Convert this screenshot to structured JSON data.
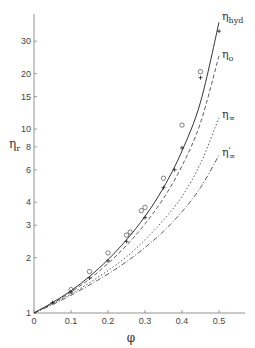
{
  "chart_data": {
    "type": "line",
    "title": "",
    "xlabel": "φ",
    "ylabel": "ηr",
    "xscale": "linear",
    "yscale": "log",
    "xlim": [
      0,
      0.57
    ],
    "ylim": [
      1,
      45
    ],
    "x_ticks": [
      0,
      0.1,
      0.2,
      0.3,
      0.4,
      0.5
    ],
    "x_tick_labels": [
      "0",
      "0.1",
      "0.2",
      "0.3",
      "0.4",
      "0.5"
    ],
    "y_ticks": [
      1,
      2,
      3,
      4,
      6,
      8,
      10,
      15,
      20,
      30
    ],
    "y_tick_labels": [
      "1",
      "2",
      "3",
      "4",
      "6",
      "8",
      "10",
      "15",
      "20",
      "30"
    ],
    "grid": false,
    "legend": "inline labels at curve ends",
    "series": [
      {
        "name": "η_hyd",
        "label_main": "η",
        "label_sub": "hyd",
        "label_sup": "",
        "style": "solid",
        "x": [
          0,
          0.05,
          0.1,
          0.15,
          0.2,
          0.25,
          0.3,
          0.35,
          0.4,
          0.45,
          0.5
        ],
        "values": [
          1.0,
          1.14,
          1.32,
          1.58,
          1.95,
          2.5,
          3.35,
          4.8,
          7.6,
          14.0,
          38.0
        ]
      },
      {
        "name": "η_o",
        "label_main": "η",
        "label_sub": "o",
        "label_sup": "",
        "style": "dashed",
        "x": [
          0,
          0.05,
          0.1,
          0.15,
          0.2,
          0.25,
          0.3,
          0.35,
          0.4,
          0.45,
          0.5
        ],
        "values": [
          1.0,
          1.13,
          1.3,
          1.53,
          1.86,
          2.33,
          3.05,
          4.2,
          6.3,
          10.8,
          25.0
        ]
      },
      {
        "name": "η_∞",
        "label_main": "η",
        "label_sub": "∞",
        "label_sup": "",
        "style": "dotted",
        "x": [
          0,
          0.05,
          0.1,
          0.15,
          0.2,
          0.25,
          0.3,
          0.35,
          0.4,
          0.45,
          0.5
        ],
        "values": [
          1.0,
          1.12,
          1.27,
          1.46,
          1.7,
          2.02,
          2.5,
          3.2,
          4.3,
          6.5,
          11.5
        ]
      },
      {
        "name": "η'_∞",
        "label_main": "η",
        "label_sub": "∞",
        "label_sup": "'",
        "style": "dashdot",
        "x": [
          0,
          0.05,
          0.1,
          0.15,
          0.2,
          0.25,
          0.3,
          0.35,
          0.4,
          0.45,
          0.5
        ],
        "values": [
          1.0,
          1.11,
          1.25,
          1.42,
          1.63,
          1.9,
          2.27,
          2.78,
          3.55,
          4.8,
          7.2
        ]
      }
    ],
    "markers": [
      {
        "name": "circles",
        "symbol": "o",
        "x": [
          0.1,
          0.15,
          0.2,
          0.25,
          0.26,
          0.29,
          0.3,
          0.35,
          0.4,
          0.45
        ],
        "values": [
          1.34,
          1.68,
          2.12,
          2.65,
          2.75,
          3.6,
          3.75,
          5.4,
          10.5,
          20.5
        ]
      },
      {
        "name": "crosses",
        "symbol": "+",
        "x": [
          0.05,
          0.1,
          0.15,
          0.2,
          0.25,
          0.3,
          0.35,
          0.38,
          0.4,
          0.45,
          0.5
        ],
        "values": [
          1.14,
          1.3,
          1.55,
          1.92,
          2.45,
          3.3,
          4.8,
          6.0,
          7.9,
          19.0,
          34.0
        ]
      }
    ]
  }
}
